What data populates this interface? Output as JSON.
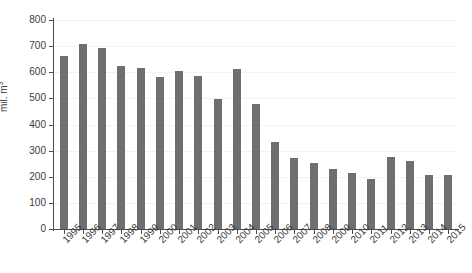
{
  "chart_data": {
    "type": "bar",
    "title": "",
    "subtitle": "",
    "xlabel": "",
    "ylabel": "mil. m",
    "ylabel_superscript": "3",
    "ylim": [
      0,
      800
    ],
    "yticks": [
      0,
      100,
      200,
      300,
      400,
      500,
      600,
      700,
      800
    ],
    "grid": true,
    "grid_axis": "y",
    "legend": false,
    "legend_position": "none",
    "bar_color": "#6f6f6f",
    "axis_color": "#4d4d4d",
    "grid_color": "#f2f2f2",
    "background_color": "#ffffff",
    "categories": [
      "1995",
      "1996",
      "1997",
      "1998",
      "1999",
      "2000",
      "2001",
      "2002",
      "2003",
      "2004",
      "2005",
      "2006",
      "2007",
      "2008",
      "2009",
      "2010",
      "2011",
      "2012",
      "2013",
      "2014",
      "2015"
    ],
    "values": [
      663,
      708,
      693,
      625,
      615,
      580,
      605,
      585,
      497,
      613,
      478,
      333,
      272,
      253,
      230,
      215,
      193,
      277,
      260,
      208,
      205
    ]
  }
}
